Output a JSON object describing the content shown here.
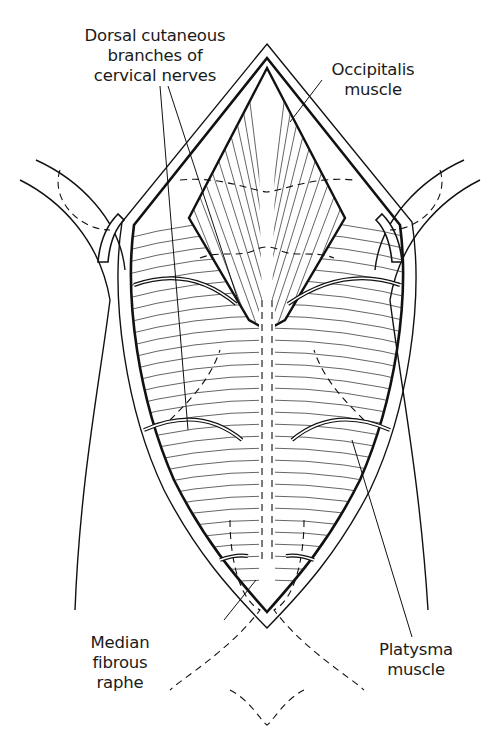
{
  "figure": {
    "type": "anatomical line illustration",
    "stroke_color": "#111111",
    "background_color": "#ffffff"
  },
  "labels": {
    "dorsal_cutaneous": {
      "lines": [
        "Dorsal cutaneous",
        "branches of",
        "cervical nerves"
      ]
    },
    "occipitalis": {
      "lines": [
        "Occipitalis",
        "muscle"
      ]
    },
    "median_raphe": {
      "lines": [
        "Median",
        "fibrous",
        "raphe"
      ]
    },
    "platysma": {
      "lines": [
        "Platysma",
        "muscle"
      ]
    }
  }
}
